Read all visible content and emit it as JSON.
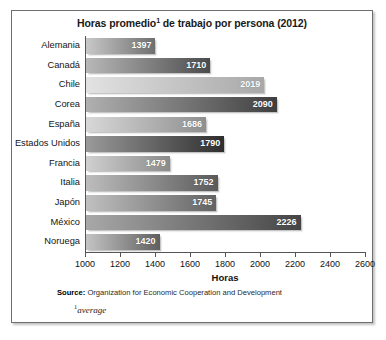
{
  "chart": {
    "title_main": "Horas promedio",
    "title_sup": "1",
    "title_rest": " de trabajo por persona (2012)",
    "x_axis_title": "Horas",
    "source_label": "Source:",
    "source_text": " Organization for Economic Cooperation and Development",
    "footnote_sup": "1",
    "footnote_text": "average"
  },
  "chart_data": {
    "type": "bar",
    "orientation": "horizontal",
    "xlabel": "Horas",
    "ylabel": "",
    "xlim": [
      1000,
      2600
    ],
    "xticks": [
      1000,
      1200,
      1400,
      1600,
      1800,
      2000,
      2200,
      2400,
      2600
    ],
    "grid": false,
    "legend": "none",
    "categories": [
      "Alemania",
      "Canadá",
      "Chile",
      "Corea",
      "España",
      "Estados Unidos",
      "Francia",
      "Italia",
      "Japón",
      "México",
      "Noruega"
    ],
    "values": [
      1397,
      1710,
      2019,
      2090,
      1686,
      1790,
      1479,
      1752,
      1745,
      2226,
      1420
    ],
    "bar_styles": [
      {
        "from": "#c8c8c8",
        "to": "#6f6f6f"
      },
      {
        "from": "#b8b8b8",
        "to": "#4b4b4b"
      },
      {
        "from": "#e2e2e2",
        "to": "#a8a8a8"
      },
      {
        "from": "#b0b0b0",
        "to": "#3f3f3f"
      },
      {
        "from": "#d8d8d8",
        "to": "#8f8f8f"
      },
      {
        "from": "#9a9a9a",
        "to": "#2e2e2e"
      },
      {
        "from": "#d0d0d0",
        "to": "#8a8a8a"
      },
      {
        "from": "#bdbdbd",
        "to": "#5a5a5a"
      },
      {
        "from": "#c0c0c0",
        "to": "#636363"
      },
      {
        "from": "#a8a8a8",
        "to": "#454545"
      },
      {
        "from": "#c4c4c4",
        "to": "#5f5f5f"
      }
    ],
    "source": "Organization for Economic Cooperation and Development",
    "footnote": "¹average"
  }
}
